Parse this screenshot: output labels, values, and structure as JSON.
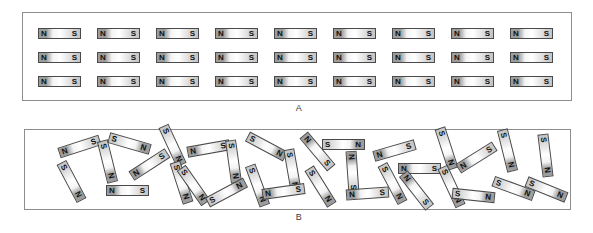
{
  "figure": {
    "title": "",
    "panels": [
      {
        "id": "A",
        "label": "A",
        "description": "aligned-magnetic-domains",
        "rows": 3,
        "cols": 9
      },
      {
        "id": "B",
        "label": "B",
        "description": "randomly-oriented-magnetic-domains"
      }
    ]
  },
  "magnet": {
    "north_label": "N",
    "south_label": "S",
    "border_color": "#4a4a4a",
    "north_shade": "#9d9d9d",
    "south_shade": "#c4c4c4"
  },
  "panel_a": {
    "label": "A",
    "row_tops": [
      28,
      52,
      76
    ],
    "col_lefts": [
      38,
      97,
      156,
      215,
      274,
      333,
      392,
      451,
      510
    ],
    "magnets": [
      {
        "x": 38,
        "y": 28,
        "rot": 0,
        "n": "N",
        "s": "S"
      },
      {
        "x": 97,
        "y": 28,
        "rot": 0,
        "n": "N",
        "s": "S"
      },
      {
        "x": 156,
        "y": 28,
        "rot": 0,
        "n": "N",
        "s": "S"
      },
      {
        "x": 215,
        "y": 28,
        "rot": 0,
        "n": "N",
        "s": "S"
      },
      {
        "x": 274,
        "y": 28,
        "rot": 0,
        "n": "N",
        "s": "S"
      },
      {
        "x": 333,
        "y": 28,
        "rot": 0,
        "n": "N",
        "s": "S"
      },
      {
        "x": 392,
        "y": 28,
        "rot": 0,
        "n": "N",
        "s": "S"
      },
      {
        "x": 451,
        "y": 28,
        "rot": 0,
        "n": "N",
        "s": "S"
      },
      {
        "x": 510,
        "y": 28,
        "rot": 0,
        "n": "N",
        "s": "S"
      },
      {
        "x": 38,
        "y": 52,
        "rot": 0,
        "n": "N",
        "s": "S"
      },
      {
        "x": 97,
        "y": 52,
        "rot": 0,
        "n": "N",
        "s": "S"
      },
      {
        "x": 156,
        "y": 52,
        "rot": 0,
        "n": "N",
        "s": "S"
      },
      {
        "x": 215,
        "y": 52,
        "rot": 0,
        "n": "N",
        "s": "S"
      },
      {
        "x": 274,
        "y": 52,
        "rot": 0,
        "n": "N",
        "s": "S"
      },
      {
        "x": 333,
        "y": 52,
        "rot": 0,
        "n": "N",
        "s": "S"
      },
      {
        "x": 392,
        "y": 52,
        "rot": 0,
        "n": "N",
        "s": "S"
      },
      {
        "x": 451,
        "y": 52,
        "rot": 0,
        "n": "N",
        "s": "S"
      },
      {
        "x": 510,
        "y": 52,
        "rot": 0,
        "n": "N",
        "s": "S"
      },
      {
        "x": 38,
        "y": 76,
        "rot": 0,
        "n": "N",
        "s": "S"
      },
      {
        "x": 97,
        "y": 76,
        "rot": 0,
        "n": "N",
        "s": "S"
      },
      {
        "x": 156,
        "y": 76,
        "rot": 0,
        "n": "N",
        "s": "S"
      },
      {
        "x": 215,
        "y": 76,
        "rot": 0,
        "n": "N",
        "s": "S"
      },
      {
        "x": 274,
        "y": 76,
        "rot": 0,
        "n": "N",
        "s": "S"
      },
      {
        "x": 333,
        "y": 76,
        "rot": 0,
        "n": "N",
        "s": "S"
      },
      {
        "x": 392,
        "y": 76,
        "rot": 0,
        "n": "N",
        "s": "S"
      },
      {
        "x": 451,
        "y": 76,
        "rot": 0,
        "n": "N",
        "s": "S"
      },
      {
        "x": 510,
        "y": 76,
        "rot": 0,
        "n": "N",
        "s": "S"
      }
    ]
  },
  "panel_b": {
    "label": "B",
    "magnets": [
      {
        "x": 58,
        "y": 141,
        "rot": -18,
        "n": "N",
        "s": "S"
      },
      {
        "x": 50,
        "y": 176,
        "rot": 62,
        "n": "S",
        "s": "N"
      },
      {
        "x": 108,
        "y": 138,
        "rot": 16,
        "n": "S",
        "s": "N"
      },
      {
        "x": 86,
        "y": 156,
        "rot": 76,
        "n": "S",
        "s": "N"
      },
      {
        "x": 106,
        "y": 185,
        "rot": 0,
        "n": "N",
        "s": "S"
      },
      {
        "x": 128,
        "y": 159,
        "rot": -33,
        "n": "N",
        "s": "S"
      },
      {
        "x": 151,
        "y": 140,
        "rot": 65,
        "n": "S",
        "s": "N"
      },
      {
        "x": 160,
        "y": 177,
        "rot": 72,
        "n": "S",
        "s": "N"
      },
      {
        "x": 187,
        "y": 143,
        "rot": -10,
        "n": "N",
        "s": "S"
      },
      {
        "x": 172,
        "y": 180,
        "rot": 55,
        "n": "S",
        "s": "N"
      },
      {
        "x": 212,
        "y": 156,
        "rot": 82,
        "n": "S",
        "s": "N"
      },
      {
        "x": 205,
        "y": 187,
        "rot": -28,
        "n": "S",
        "s": "N"
      },
      {
        "x": 245,
        "y": 141,
        "rot": 28,
        "n": "S",
        "s": "N"
      },
      {
        "x": 236,
        "y": 180,
        "rot": 70,
        "n": "S",
        "s": "N"
      },
      {
        "x": 271,
        "y": 165,
        "rot": 80,
        "n": "S",
        "s": "N"
      },
      {
        "x": 262,
        "y": 186,
        "rot": -8,
        "n": "N",
        "s": "S"
      },
      {
        "x": 296,
        "y": 146,
        "rot": 50,
        "n": "N",
        "s": "S"
      },
      {
        "x": 299,
        "y": 181,
        "rot": 58,
        "n": "S",
        "s": "N"
      },
      {
        "x": 322,
        "y": 139,
        "rot": 0,
        "n": "S",
        "s": "N"
      },
      {
        "x": 331,
        "y": 167,
        "rot": 86,
        "n": "N",
        "s": "S"
      },
      {
        "x": 346,
        "y": 188,
        "rot": -4,
        "n": "N",
        "s": "S"
      },
      {
        "x": 373,
        "y": 145,
        "rot": -16,
        "n": "N",
        "s": "S"
      },
      {
        "x": 371,
        "y": 178,
        "rot": 62,
        "n": "S",
        "s": "N"
      },
      {
        "x": 398,
        "y": 163,
        "rot": 0,
        "n": "N",
        "s": "S"
      },
      {
        "x": 395,
        "y": 185,
        "rot": 52,
        "n": "N",
        "s": "S"
      },
      {
        "x": 425,
        "y": 143,
        "rot": 72,
        "n": "S",
        "s": "N"
      },
      {
        "x": 430,
        "y": 181,
        "rot": 65,
        "n": "S",
        "s": "N"
      },
      {
        "x": 455,
        "y": 152,
        "rot": -32,
        "n": "N",
        "s": "S"
      },
      {
        "x": 452,
        "y": 190,
        "rot": 6,
        "n": "S",
        "s": "N"
      },
      {
        "x": 486,
        "y": 145,
        "rot": 76,
        "n": "S",
        "s": "N"
      },
      {
        "x": 492,
        "y": 183,
        "rot": 20,
        "n": "S",
        "s": "N"
      },
      {
        "x": 524,
        "y": 150,
        "rot": 83,
        "n": "S",
        "s": "N"
      },
      {
        "x": 525,
        "y": 184,
        "rot": 22,
        "n": "S",
        "s": "N"
      }
    ]
  }
}
